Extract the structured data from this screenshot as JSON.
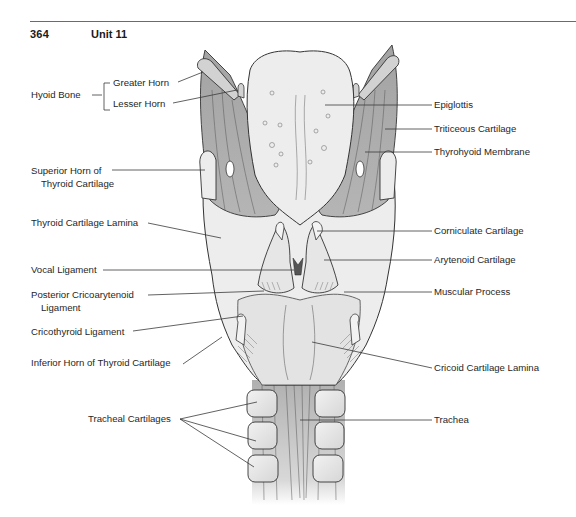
{
  "page": {
    "page_number": "364",
    "unit_title": "Unit 11"
  },
  "figure": {
    "labels_left": {
      "hyoid_bone": "Hyoid Bone",
      "greater_horn": "Greater Horn",
      "lesser_horn": "Lesser Horn",
      "superior_horn_line1": "Superior Horn of",
      "superior_horn_line2": "Thyroid Cartilage",
      "thyroid_lamina": "Thyroid Cartilage Lamina",
      "vocal_ligament": "Vocal Ligament",
      "post_crico_line1": "Posterior Cricoarytenoid",
      "post_crico_line2": "Ligament",
      "cricothyroid_ligament": "Cricothyroid Ligament",
      "inferior_horn": "Inferior Horn of Thyroid Cartilage",
      "tracheal_cartilages": "Tracheal Cartilages"
    },
    "labels_right": {
      "epiglottis": "Epiglottis",
      "triticeous": "Triticeous Cartilage",
      "thyrohyoid": "Thyrohyoid Membrane",
      "corniculate": "Corniculate Cartilage",
      "arytenoid": "Arytenoid Cartilage",
      "muscular_process": "Muscular Process",
      "cricoid_lamina": "Cricoid Cartilage Lamina",
      "trachea": "Trachea"
    },
    "colors": {
      "membrane": "#a9a9a9",
      "cartilage": "#e6e6e6",
      "epiglottis": "#ececec",
      "outline": "#3a3a3a",
      "leader": "#3a3a3a"
    }
  }
}
